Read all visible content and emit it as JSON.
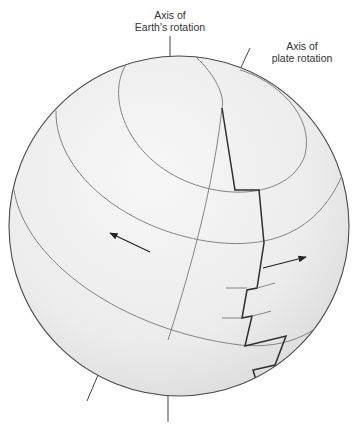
{
  "labels": {
    "earth_axis": {
      "line1": "Axis of",
      "line2": "Earth's rotation"
    },
    "plate_axis": {
      "line1": "Axis of",
      "line2": "plate rotation"
    }
  },
  "colors": {
    "sphere_fill": "#ececec",
    "sphere_outline": "#4a4a4a",
    "grid_line": "#777777",
    "ridge_line": "#2f2f2f",
    "text": "#333333",
    "background": "#ffffff"
  },
  "arrows": [
    {
      "name": "plate-motion-left",
      "direction": "west"
    },
    {
      "name": "plate-motion-right",
      "direction": "east"
    }
  ]
}
